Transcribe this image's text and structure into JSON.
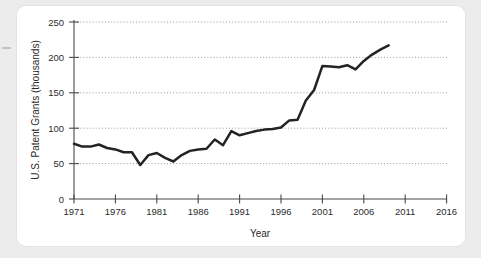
{
  "figure": {
    "background_color": "#ececec",
    "card_color": "#ffffff",
    "line_color": "#232323",
    "grid_color": "#8d8d8d",
    "axis_color": "#4a4a4a"
  },
  "chart_data": {
    "type": "line",
    "title": "",
    "xlabel": "Year",
    "ylabel": "U.S. Patent Grants (thousands)",
    "xlim": [
      1971,
      2016
    ],
    "ylim": [
      0,
      250
    ],
    "xticks": [
      1971,
      1976,
      1981,
      1986,
      1991,
      1996,
      2001,
      2006,
      2011,
      2016
    ],
    "xtick_labels": [
      "1971",
      "1976",
      "1981",
      "1986",
      "1991",
      "1996",
      "2001",
      "2006",
      "2011",
      "2016"
    ],
    "yticks": [
      0,
      50,
      100,
      150,
      200,
      250
    ],
    "ytick_labels": [
      "0",
      "50",
      "100",
      "150",
      "200",
      "250"
    ],
    "grid": "horizontal-dotted",
    "legend": "none",
    "series": [
      {
        "name": "U.S. Patent Grants",
        "x": [
          1971,
          1972,
          1973,
          1974,
          1975,
          1976,
          1977,
          1978,
          1979,
          1980,
          1981,
          1982,
          1983,
          1984,
          1985,
          1986,
          1987,
          1988,
          1989,
          1990,
          1991,
          1992,
          1993,
          1994,
          1995,
          1996,
          1997,
          1998,
          1999,
          2000,
          2001,
          2002,
          2003,
          2004,
          2005,
          2006,
          2007,
          2008,
          2009
        ],
        "values": [
          78,
          74,
          74,
          76,
          72,
          70,
          65,
          66,
          48,
          62,
          65,
          58,
          57,
          67,
          71,
          70,
          83,
          78,
          95,
          90,
          96,
          97,
          98,
          101,
          101,
          109,
          111,
          139,
          169,
          182,
          184,
          177,
          181,
          164,
          157,
          173,
          182,
          185,
          191
        ],
        "display_values": [
          78,
          74,
          74,
          77,
          72,
          70,
          66,
          66,
          48,
          62,
          65,
          58,
          53,
          62,
          68,
          70,
          71,
          84,
          76,
          96,
          90,
          93,
          96,
          98,
          99,
          101,
          111,
          112,
          139,
          154,
          188,
          187,
          186,
          189,
          183,
          195,
          204,
          211,
          217
        ]
      }
    ]
  }
}
